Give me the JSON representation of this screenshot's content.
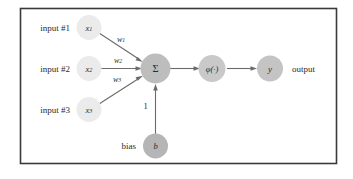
{
  "diagram": {
    "frame": {
      "stroke_color": "#3a3a3a"
    },
    "colors": {
      "input_node": "#ebebeb",
      "sum_node": "#bdbdbd",
      "activation_node": "#c9c9c9",
      "output_node": "#c4c4c4",
      "bias_node": "#b5b5b5",
      "edge": "#6b6b6b",
      "text": "#2b2b2b"
    },
    "inputs": [
      {
        "label": "input #1",
        "node": "x",
        "sub": "1",
        "weight": "w",
        "weight_sub": "1"
      },
      {
        "label": "input #2",
        "node": "x",
        "sub": "2",
        "weight": "w",
        "weight_sub": "2"
      },
      {
        "label": "input #3",
        "node": "x",
        "sub": "3",
        "weight": "w",
        "weight_sub": "3"
      }
    ],
    "sum_node": {
      "label": "Σ"
    },
    "activation_node": {
      "label": "φ(·)"
    },
    "output_node": {
      "label": "y",
      "caption": "output"
    },
    "bias": {
      "label": "bias",
      "node": "b",
      "weight": "1"
    }
  }
}
